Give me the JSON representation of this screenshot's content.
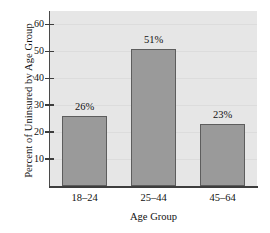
{
  "chart_data": {
    "type": "bar",
    "title": "",
    "categories": [
      "18–24",
      "25–44",
      "45–64"
    ],
    "values": [
      26,
      51,
      23
    ],
    "data_labels": [
      "26%",
      "51%",
      "23%"
    ],
    "xlabel": "Age Group",
    "ylabel": "Percent of Uninsured by Age Group",
    "ylim": [
      0,
      65
    ],
    "yticks": [
      10,
      20,
      30,
      40,
      50,
      60
    ],
    "ytick_labels": [
      "10",
      "20",
      "30",
      "40",
      "50",
      "60"
    ],
    "grid": true,
    "legend": false,
    "colors": {
      "bar_fill": "#9a9a9a",
      "bar_border": "#5d5d5d",
      "plot_background": "#e6e6e6",
      "figure_background": "#ffffff",
      "axis": "#3d3d3d",
      "gridline": "#dcdcdc",
      "text": "#111111"
    }
  }
}
